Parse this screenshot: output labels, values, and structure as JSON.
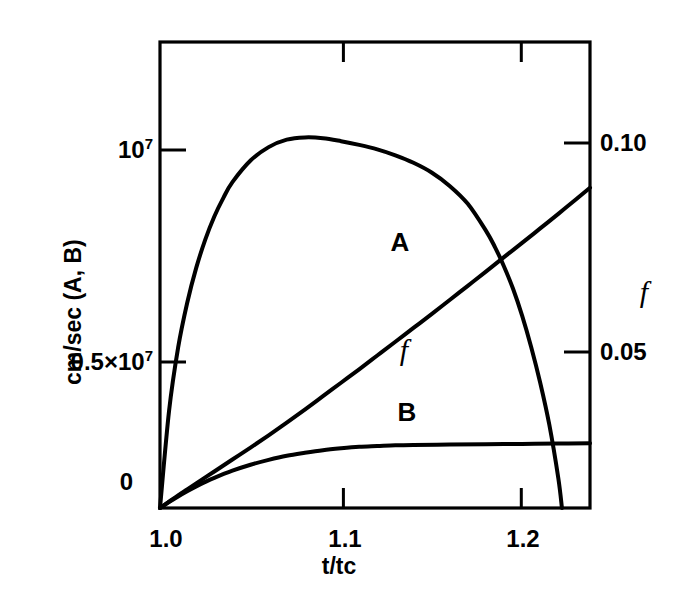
{
  "figure": {
    "background_color": "#ffffff",
    "line_color": "#000000"
  },
  "chart_data": {
    "type": "line",
    "title": "",
    "xlabel": "t/tc",
    "ylabel": "cm/sec (A, B)",
    "ylabel_right": "f",
    "xlim": [
      1.0,
      1.2375
    ],
    "ylim_left": [
      0,
      12500000.0
    ],
    "ylim_right": [
      0,
      0.0625
    ],
    "grid": false,
    "legend": "inline-curve-labels",
    "x_ticks": [
      {
        "value": 1.0,
        "label": "1.0"
      },
      {
        "value": 1.1,
        "label": "1.1"
      },
      {
        "value": 1.2,
        "label": "1.2"
      }
    ],
    "y_ticks_left": [
      {
        "value": 0,
        "label": "0"
      },
      {
        "value": 5000000,
        "label": "0.5×10",
        "exponent": "7"
      },
      {
        "value": 10000000,
        "label": "10",
        "exponent": "7"
      }
    ],
    "y_ticks_right": [
      {
        "value": 0.05,
        "label": "0.05"
      },
      {
        "value": 0.1,
        "label": "0.10"
      }
    ],
    "series": [
      {
        "name": "A",
        "label": "A",
        "axis": "left",
        "units": "cm/sec",
        "x": [
          1.0,
          1.005,
          1.01,
          1.015,
          1.02,
          1.03,
          1.04,
          1.05,
          1.06,
          1.07,
          1.08,
          1.09,
          1.1,
          1.11,
          1.12,
          1.13,
          1.14,
          1.15,
          1.16,
          1.17,
          1.18,
          1.19,
          1.2,
          1.21,
          1.22,
          1.23,
          1.2375
        ],
        "y": [
          0,
          170000,
          340000,
          500000,
          660000,
          980000,
          1300000,
          1620000,
          1950000,
          2290000,
          2640000,
          3000000,
          3360000,
          3720000,
          4090000,
          4460000,
          4830000,
          5200000,
          5580000,
          5960000,
          6340000,
          6730000,
          7110000,
          7500000,
          7890000,
          8290000,
          8590000
        ]
      },
      {
        "name": "B",
        "label": "B",
        "axis": "left",
        "units": "cm/sec",
        "x": [
          1.0,
          1.005,
          1.01,
          1.015,
          1.02,
          1.025,
          1.03,
          1.04,
          1.05,
          1.06,
          1.07,
          1.08,
          1.09,
          1.1,
          1.11,
          1.12,
          1.13,
          1.14,
          1.16,
          1.18,
          1.2,
          1.22,
          1.2375
        ],
        "y": [
          0,
          160000,
          310000,
          450000,
          580000,
          700000,
          810000,
          1000000,
          1160000,
          1290000,
          1400000,
          1480000,
          1550000,
          1600000,
          1640000,
          1660000,
          1680000,
          1690000,
          1700000,
          1710000,
          1720000,
          1730000,
          1740000
        ]
      },
      {
        "name": "f",
        "label": "f",
        "axis": "right",
        "units": "",
        "x": [
          1.0,
          1.005,
          1.01,
          1.015,
          1.02,
          1.025,
          1.03,
          1.035,
          1.04,
          1.05,
          1.06,
          1.07,
          1.08,
          1.09,
          1.1,
          1.11,
          1.12,
          1.13,
          1.14,
          1.15,
          1.16,
          1.17,
          1.18,
          1.185,
          1.19,
          1.195,
          1.2,
          1.205,
          1.21,
          1.215,
          1.22,
          1.222
        ],
        "y": [
          0,
          0.013,
          0.0215,
          0.0275,
          0.0322,
          0.036,
          0.0391,
          0.0416,
          0.0437,
          0.0466,
          0.0484,
          0.0494,
          0.0497,
          0.0496,
          0.0492,
          0.0487,
          0.0481,
          0.0473,
          0.0463,
          0.045,
          0.0432,
          0.0408,
          0.0372,
          0.035,
          0.0324,
          0.0294,
          0.0258,
          0.0216,
          0.0168,
          0.0112,
          0.004,
          0.0
        ]
      }
    ],
    "annotations": [
      {
        "text": "A",
        "x": 1.134,
        "y_axis": "left",
        "style": "bold-sans"
      },
      {
        "text": "B",
        "x": 1.138,
        "y_axis": "left",
        "style": "bold-sans"
      },
      {
        "text": "f",
        "x": 1.137,
        "y_axis": "right",
        "style": "italic-serif"
      }
    ]
  }
}
